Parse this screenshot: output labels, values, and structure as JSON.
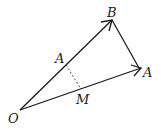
{
  "diagram": {
    "points": {
      "O": {
        "label": "O",
        "x": 20,
        "y": 110
      },
      "B": {
        "label": "B",
        "x": 112,
        "y": 20
      },
      "A_right": {
        "label": "A",
        "x": 141,
        "y": 68
      },
      "A_on_OB": {
        "label": "A",
        "x": 66,
        "y": 65
      },
      "M": {
        "label": "M",
        "x": 81,
        "y": 89
      }
    },
    "segments": [
      {
        "from": "O",
        "to": "B",
        "style": "solid",
        "arrow": true
      },
      {
        "from": "O",
        "to": "A_right",
        "style": "solid",
        "arrow": true
      },
      {
        "from": "B",
        "to": "A_right",
        "style": "solid",
        "arrow": false
      },
      {
        "from": "A_on_OB",
        "to": "M",
        "style": "dashed",
        "arrow": false
      }
    ],
    "colors": {
      "stroke": "#1a1a1a",
      "dashed": "#555555",
      "background": "#ffffff"
    }
  }
}
